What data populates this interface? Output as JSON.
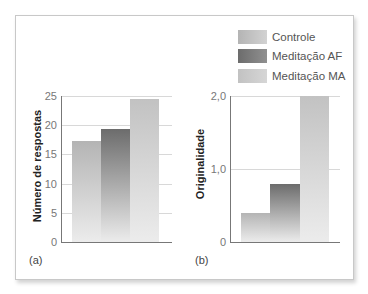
{
  "legend": {
    "items": [
      {
        "label": "Controle",
        "color_top": "#b4b4b4",
        "color_bottom": "#d2d2d2"
      },
      {
        "label": "Meditação AF",
        "color_top": "#6c6c6c",
        "color_bottom": "#909090"
      },
      {
        "label": "Meditação MA",
        "color_top": "#c2c2c2",
        "color_bottom": "#d6d6d6"
      }
    ]
  },
  "panels": {
    "a": {
      "label": "(a)",
      "ylabel": "Número de respostas",
      "ticks": [
        "0",
        "5",
        "10",
        "15",
        "20",
        "25"
      ]
    },
    "b": {
      "label": "(b)",
      "ylabel": "Originalidade",
      "ticks": [
        "0",
        "1,0",
        "2,0"
      ]
    }
  },
  "chart_data": [
    {
      "type": "bar",
      "title": "",
      "panel": "(a)",
      "categories": [
        "Controle",
        "Meditação AF",
        "Meditação MA"
      ],
      "values": [
        17.3,
        19.3,
        24.5
      ],
      "xlabel": "",
      "ylabel": "Número de respostas",
      "ylim": [
        0,
        25
      ],
      "yticks": [
        0,
        5,
        10,
        15,
        20,
        25
      ],
      "grid": true,
      "legend_position": "top-right"
    },
    {
      "type": "bar",
      "title": "",
      "panel": "(b)",
      "categories": [
        "Controle",
        "Meditação AF",
        "Meditação MA"
      ],
      "values": [
        0.4,
        0.8,
        2.0
      ],
      "xlabel": "",
      "ylabel": "Originalidade",
      "ylim": [
        0,
        2.0
      ],
      "yticks": [
        0,
        1.0,
        2.0
      ],
      "ytick_labels": [
        "0",
        "1,0",
        "2,0"
      ],
      "grid": true,
      "legend_position": "top-right"
    }
  ]
}
